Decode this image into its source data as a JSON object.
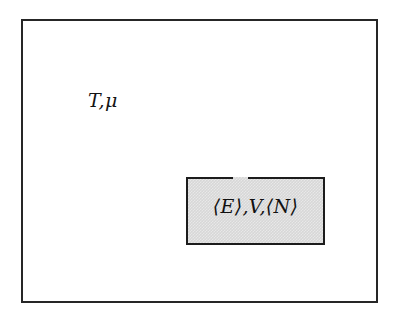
{
  "figure": {
    "type": "thermodynamic-ensemble-diagram",
    "ensemble_name": "grand canonical ensemble",
    "background_color": "#ffffff"
  },
  "reservoir": {
    "name": "reservoir-box",
    "label": "T,μ",
    "label_parts": {
      "temperature": "T",
      "separator": ",",
      "chemical_potential": "μ"
    },
    "border_color": "#262626",
    "border_width_px": 2,
    "fill_color": "#ffffff"
  },
  "system": {
    "name": "system-box",
    "label": "⟨E⟩,V,⟨N⟩",
    "label_parts": {
      "mean_energy": "⟨E⟩",
      "volume": "V",
      "mean_particle_number": "⟨N⟩",
      "separator": ","
    },
    "fill_color": "#d7d7d7",
    "border_color": "#1c1c1c",
    "border_width_px": 2,
    "has_top_opening": true,
    "opening_description": "gap in the top border"
  }
}
